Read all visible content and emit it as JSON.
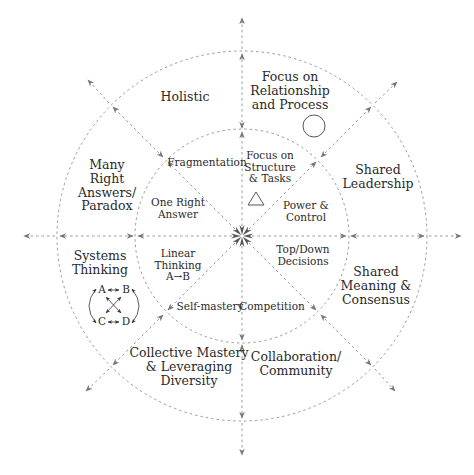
{
  "diagram": {
    "center": [
      242,
      236
    ],
    "outer_radius": 185,
    "inner_radius": 107,
    "line_color": "#888888",
    "text_color": "#2a2a2a",
    "inner_ring": {
      "top_right": "Focus on\nStructure\n& Tasks",
      "right_upper": "Power &\nControl",
      "right_lower": "Top/Down\nDecisions",
      "bottom_right": "Competition",
      "bottom_left": "Self-mastery",
      "left_lower": "Linear\nThinking\nA→B",
      "left_upper": "One Right\nAnswer",
      "top_left": "Fragmentation"
    },
    "outer_ring": {
      "top_right": "Focus on\nRelationship\nand Process",
      "right_upper": "Shared\nLeadership",
      "right_lower": "Shared\nMeaning &\nConsensus",
      "bottom_right": "Collaboration/\nCommunity",
      "bottom_left": "Collective Mastery\n& Leveraging\nDiversity",
      "left_lower": "Systems\nThinking",
      "left_upper": "Many\nRight\nAnswers/\nParadox",
      "top_left": "Holistic"
    },
    "symbols": {
      "triangle": "triangle-icon",
      "circle": "circle-icon",
      "abcd": {
        "nodes": [
          "A",
          "B",
          "C",
          "D"
        ]
      }
    }
  }
}
